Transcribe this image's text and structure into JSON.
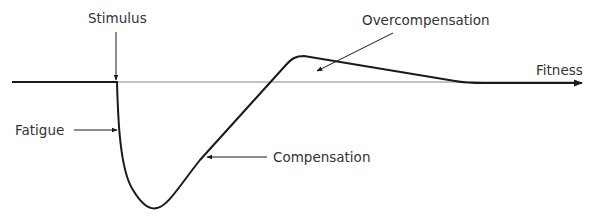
{
  "diagram": {
    "labels": {
      "stimulus": "Stimulus",
      "fatigue": "Fatigue",
      "compensation": "Compensation",
      "overcompensation": "Overcompensation",
      "fitness": "Fitness"
    },
    "colors": {
      "curve": "#1a1a1a",
      "baseline": "#888888",
      "text": "#333333"
    }
  }
}
